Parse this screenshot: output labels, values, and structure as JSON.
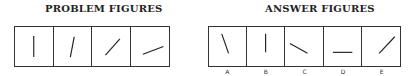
{
  "problem": {
    "title": "PROBLEM FIGURES",
    "figures": [
      {
        "x1": 19.5,
        "y1": 9,
        "x2": 19.5,
        "y2": 31
      },
      {
        "x1": 21,
        "y1": 10,
        "x2": 17,
        "y2": 31
      },
      {
        "x1": 29,
        "y1": 12,
        "x2": 14,
        "y2": 29
      },
      {
        "x1": 33,
        "y1": 20,
        "x2": 12,
        "y2": 28
      }
    ]
  },
  "answers": {
    "title": "ANSWER FIGURES",
    "options": [
      {
        "label": "A",
        "line": {
          "x1": 13,
          "y1": 7,
          "x2": 20,
          "y2": 27
        }
      },
      {
        "label": "B",
        "line": {
          "x1": 19,
          "y1": 7,
          "x2": 19,
          "y2": 26
        }
      },
      {
        "label": "C",
        "line": {
          "x1": 5,
          "y1": 17,
          "x2": 23,
          "y2": 27
        }
      },
      {
        "label": "D",
        "line": {
          "x1": 9,
          "y1": 26,
          "x2": 29,
          "y2": 26
        }
      },
      {
        "label": "E",
        "line": {
          "x1": 17,
          "y1": 27,
          "x2": 33,
          "y2": 10
        }
      }
    ]
  },
  "colors": {
    "stroke": "#222222",
    "border": "#333333"
  }
}
